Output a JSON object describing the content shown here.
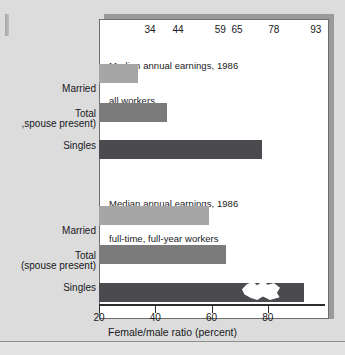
{
  "chart_data": {
    "type": "bar",
    "orientation": "horizontal",
    "title": "",
    "xlabel": "Female/male ratio (percent)",
    "ylabel": "",
    "xlim": [
      20,
      100
    ],
    "xticks": [
      20,
      40,
      60,
      80
    ],
    "xtick_labels": [
      "20",
      "40",
      "60",
      "80"
    ],
    "grid": false,
    "legend": false,
    "groups": [
      {
        "caption": "Median annual earnings, 1986\nall workers",
        "caption_line1": "Median annual earnings, 1986",
        "caption_line2": "all workers",
        "categories": [
          "Married (spouse present)",
          "Total",
          "Singles"
        ],
        "values": [
          34,
          44,
          78
        ]
      },
      {
        "caption": "Median annual earnings, 1986\nfull-time, full-year workers",
        "caption_line1": "Median annual earnings, 1986",
        "caption_line2": "full-time, full-year workers",
        "categories": [
          "Married (spouse present)",
          "Total",
          "Singles"
        ],
        "values": [
          59,
          65,
          93
        ]
      }
    ],
    "bars": [
      {
        "label_line1": "Married",
        "label_line2": ",spouse present)",
        "value": 34,
        "value_text": "34",
        "shade": "light"
      },
      {
        "label_line1": "",
        "label_line2": "Total",
        "value": 44,
        "value_text": "44",
        "shade": "medium"
      },
      {
        "label_line1": "",
        "label_line2": "Singles",
        "value": 78,
        "value_text": "78",
        "shade": "dark"
      },
      {
        "label_line1": "Married",
        "label_line2": "(spouse present)",
        "value": 59,
        "value_text": "59",
        "shade": "light"
      },
      {
        "label_line1": "",
        "label_line2": "Total",
        "value": 65,
        "value_text": "65",
        "shade": "medium"
      },
      {
        "label_line1": "",
        "label_line2": "Singles",
        "value": 93,
        "value_text": "93",
        "shade": "dark"
      }
    ],
    "colors": {
      "bar_light": "#a6a6a6",
      "bar_medium": "#7b7b7b",
      "bar_dark": "#4b4b4f",
      "panel_background": "#ffffff",
      "page_background": "#dcdcdc",
      "axis": "#2c2c30",
      "text": "#18181b"
    }
  }
}
